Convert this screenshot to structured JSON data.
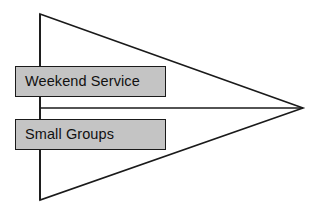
{
  "diagram": {
    "type": "funnel-arrow-diagram",
    "background_color": "#ffffff",
    "outline_color": "#1a1a1a",
    "box_fill_color": "#c4c4c4",
    "text_color": "#111111",
    "shape": {
      "name": "right-pointing-triangle",
      "top_vertex": "40,14",
      "bottom_vertex": "40,200",
      "apex_vertex": "303,108"
    },
    "divider_line": {
      "name": "midline",
      "from": "40,108",
      "to": "303,108"
    },
    "stages": [
      {
        "label": "Weekend Service"
      },
      {
        "label": "Small Groups"
      }
    ]
  }
}
